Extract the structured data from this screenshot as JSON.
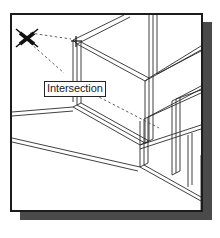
{
  "app": {
    "title": "Intersection Object Snap",
    "figure_caption": "Intersection"
  },
  "panel": {
    "background_color": "#ffffff",
    "border_color": "#1c1c1c",
    "shadow_color": "#4a4a4a",
    "x": 10,
    "y": 13,
    "width": 193,
    "height": 199
  },
  "tooltip": {
    "label": "Intersection",
    "x": 32,
    "y": 66,
    "background_color": "#ffffff",
    "border_color": "#242424",
    "text_color": "#1a1a1a"
  },
  "markers": {
    "intersection_marker": {
      "name": "intersection-x-marker",
      "shape": "X",
      "center_x": 23,
      "center_y": 35,
      "size": 19,
      "color": "#111111"
    },
    "snap_point_marker": {
      "name": "snap-point-crosshair",
      "shape": "plus",
      "center_x": 65,
      "center_y": 27,
      "size": 9,
      "color": "#111111"
    }
  },
  "tracking_lines": {
    "color": "#4d4d4d",
    "style": "dashed",
    "segments": [
      {
        "name": "tracking-up-right",
        "x1": 28,
        "y1": 31,
        "x2": 63,
        "y2": 26
      },
      {
        "name": "tracking-down-right",
        "x1": 28,
        "y1": 40,
        "x2": 62,
        "y2": 70
      },
      {
        "name": "tracking-diagonal-lower",
        "x1": 83,
        "y1": 80,
        "x2": 147,
        "y2": 113
      }
    ]
  },
  "geometry": {
    "line_color": "#2b2b2b",
    "fill_color": "#f2f2f2",
    "description": "isometric wireframe of structural framing members"
  },
  "colors": {
    "page_background": "#ffffff",
    "panel_background": "#ffffff",
    "panel_border": "#1c1c1c",
    "shadow": "#4a4a4a",
    "geometry_line": "#2b2b2b",
    "tracking_line": "#4d4d4d",
    "marker": "#111111"
  }
}
